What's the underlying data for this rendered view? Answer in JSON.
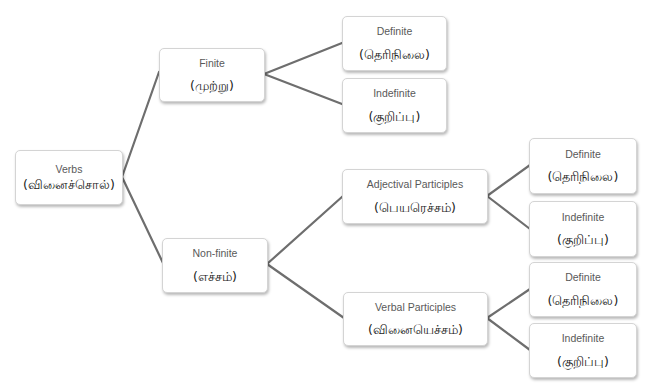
{
  "diagram": {
    "line_color": "#6e6e6e",
    "nodes": {
      "verbs": {
        "en": "Verbs",
        "ta": "(வினைச்சொல்)"
      },
      "finite": {
        "en": "Finite",
        "ta": "(முற்று)"
      },
      "finite_definite": {
        "en": "Definite",
        "ta": "(தெரிநிலை)"
      },
      "finite_indefinite": {
        "en": "Indefinite",
        "ta": "(குறிப்பு)"
      },
      "nonfinite": {
        "en": "Non-finite",
        "ta": "(எச்சம்)"
      },
      "adjectival": {
        "en": "Adjectival Participles",
        "ta": "(பெயரெச்சம்)"
      },
      "adj_definite": {
        "en": "Definite",
        "ta": "(தெரிநிலை)"
      },
      "adj_indefinite": {
        "en": "Indefinite",
        "ta": "(குறிப்பு)"
      },
      "verbal": {
        "en": "Verbal Participles",
        "ta": "(வினையெச்சம்)"
      },
      "verbal_definite": {
        "en": "Definite",
        "ta": "(தெரிநிலை)"
      },
      "verbal_indefinite": {
        "en": "Indefinite",
        "ta": "(குறிப்பு)"
      }
    },
    "edges": [
      [
        "verbs",
        "finite"
      ],
      [
        "verbs",
        "nonfinite"
      ],
      [
        "finite",
        "finite_definite"
      ],
      [
        "finite",
        "finite_indefinite"
      ],
      [
        "nonfinite",
        "adjectival"
      ],
      [
        "nonfinite",
        "verbal"
      ],
      [
        "adjectival",
        "adj_definite"
      ],
      [
        "adjectival",
        "adj_indefinite"
      ],
      [
        "verbal",
        "verbal_definite"
      ],
      [
        "verbal",
        "verbal_indefinite"
      ]
    ]
  }
}
